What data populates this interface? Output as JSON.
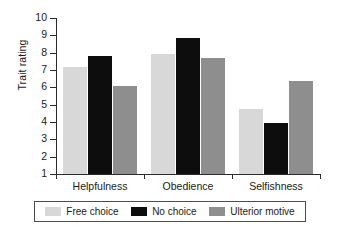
{
  "chart_data": {
    "type": "bar",
    "title": "",
    "xlabel": "",
    "ylabel": "Trait rating",
    "categories": [
      "Helpfulness",
      "Obedience",
      "Selfishness"
    ],
    "series": [
      {
        "name": "Free choice",
        "color": "#d8d8d8",
        "values": [
          7.2,
          7.95,
          4.75
        ]
      },
      {
        "name": "No choice",
        "color": "#0d0d0d",
        "values": [
          7.8,
          8.85,
          3.95
        ]
      },
      {
        "name": "Ulterior motive",
        "color": "#8e8e8e",
        "values": [
          6.1,
          7.7,
          6.35
        ]
      }
    ],
    "ylim": [
      1,
      10
    ],
    "yticks": [
      1,
      2,
      3,
      4,
      5,
      6,
      7,
      8,
      9,
      10
    ],
    "ytick_labels": [
      "1",
      "2",
      "3",
      "4",
      "5",
      "6",
      "7",
      "8",
      "9",
      "10"
    ],
    "grid": false,
    "legend_position": "bottom",
    "axis_color": "#2b2b2b",
    "background": "#ffffff"
  }
}
